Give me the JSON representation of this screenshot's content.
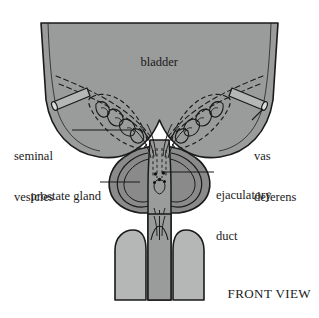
{
  "figure": {
    "view_caption": "FRONT VIEW",
    "background_color": "#ffffff",
    "colors": {
      "bladder_fill": "#9a9b9b",
      "prostate_fill": "#8a8a8a",
      "shaft_light_fill": "#b5b6b6",
      "urethra_fill": "#9a9b9b",
      "outline": "#1a1a1a",
      "label_text": "#1a1a1a"
    }
  },
  "labels": {
    "bladder": "bladder",
    "seminal_vesicles_line1": "seminal",
    "seminal_vesicles_line2": "vesicles",
    "vas_deferens_line1": "vas",
    "vas_deferens_line2": "deferens",
    "prostate_gland": "prostate gland",
    "ejaculatory_duct_line1": "ejaculatory",
    "ejaculatory_duct_line2": "duct",
    "front_view": "FRONT VIEW"
  },
  "structures": [
    {
      "name": "bladder",
      "label": "bladder",
      "fill": "#9a9b9b"
    },
    {
      "name": "seminal-vesicles",
      "label": "seminal vesicles",
      "fill": "#9a9b9b"
    },
    {
      "name": "vas-deferens",
      "label": "vas deferens",
      "fill": "#b5b6b6"
    },
    {
      "name": "prostate-gland",
      "label": "prostate gland",
      "fill": "#8a8a8a"
    },
    {
      "name": "ejaculatory-duct",
      "label": "ejaculatory duct",
      "fill": "#1a1a1a"
    },
    {
      "name": "urethra",
      "label": "urethra",
      "fill": "#9a9b9b"
    },
    {
      "name": "corpus-cavernosum-left",
      "label": "corpus cavernosum left",
      "fill": "#b5b6b6"
    },
    {
      "name": "corpus-cavernosum-right",
      "label": "corpus cavernosum right",
      "fill": "#b5b6b6"
    }
  ]
}
